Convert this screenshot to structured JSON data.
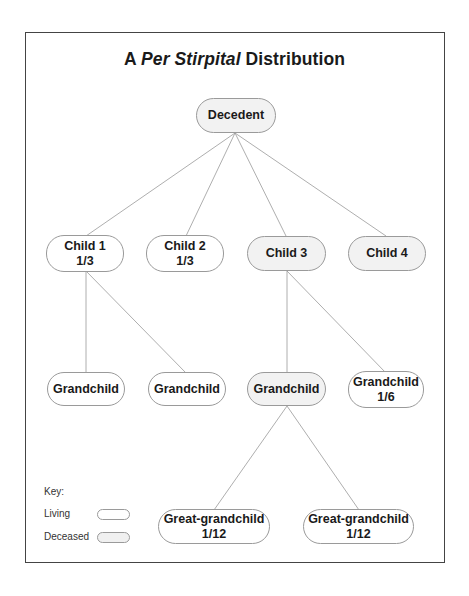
{
  "title": {
    "prefix": "A",
    "italic": "Per Stirpital",
    "suffix": "Distribution"
  },
  "colors": {
    "living_fill": "#ffffff",
    "deceased_fill": "#f2f2f2",
    "border": "#9a9a9a",
    "line": "#999999"
  },
  "nodes": {
    "decedent": {
      "label": "Decedent",
      "share": "",
      "status": "deceased"
    },
    "child1": {
      "label": "Child 1",
      "share": "1/3",
      "status": "living"
    },
    "child2": {
      "label": "Child 2",
      "share": "1/3",
      "status": "living"
    },
    "child3": {
      "label": "Child 3",
      "share": "",
      "status": "deceased"
    },
    "child4": {
      "label": "Child 4",
      "share": "",
      "status": "deceased"
    },
    "grandchild1": {
      "label": "Grandchild",
      "share": "",
      "status": "living"
    },
    "grandchild2": {
      "label": "Grandchild",
      "share": "",
      "status": "living"
    },
    "grandchild3": {
      "label": "Grandchild",
      "share": "",
      "status": "deceased"
    },
    "grandchild4": {
      "label": "Grandchild",
      "share": "1/6",
      "status": "living"
    },
    "greatgrandchild1": {
      "label": "Great-grandchild",
      "share": "1/12",
      "status": "living"
    },
    "greatgrandchild2": {
      "label": "Great-grandchild",
      "share": "1/12",
      "status": "living"
    }
  },
  "edges": [
    [
      "decedent",
      "child1"
    ],
    [
      "decedent",
      "child2"
    ],
    [
      "decedent",
      "child3"
    ],
    [
      "decedent",
      "child4"
    ],
    [
      "child1",
      "grandchild1"
    ],
    [
      "child1",
      "grandchild2"
    ],
    [
      "child3",
      "grandchild3"
    ],
    [
      "child3",
      "grandchild4"
    ],
    [
      "grandchild3",
      "greatgrandchild1"
    ],
    [
      "grandchild3",
      "greatgrandchild2"
    ]
  ],
  "key": {
    "title": "Key:",
    "living": "Living",
    "deceased": "Deceased"
  }
}
